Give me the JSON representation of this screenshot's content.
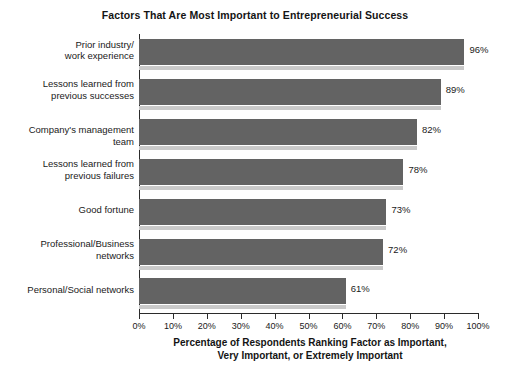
{
  "chart_data": {
    "type": "bar",
    "orientation": "horizontal",
    "title": "Factors That Are Most Important to Entrepreneurial Success",
    "xlabel_line1": "Percentage of Respondents Ranking Factor as Important,",
    "xlabel_line2": "Very Important, or Extremely Important",
    "ylabel": "",
    "xlim": [
      0,
      100
    ],
    "xticks": [
      "0%",
      "10%",
      "20%",
      "30%",
      "40%",
      "50%",
      "60%",
      "70%",
      "80%",
      "90%",
      "100%"
    ],
    "xtick_values": [
      0,
      10,
      20,
      30,
      40,
      50,
      60,
      70,
      80,
      90,
      100
    ],
    "grid": false,
    "legend": false,
    "categories": [
      "Prior industry/\nwork experience",
      "Lessons learned from\nprevious successes",
      "Company's management team",
      "Lessons learned from\nprevious failures",
      "Good fortune",
      "Professional/Business\nnetworks",
      "Personal/Social networks"
    ],
    "values": [
      96,
      89,
      82,
      78,
      73,
      72,
      61
    ],
    "value_labels": [
      "96%",
      "89%",
      "82%",
      "78%",
      "73%",
      "72%",
      "61%"
    ],
    "bar_color": "#636363",
    "shadow_color": "#c9c9c9",
    "axis_color": "#2b2b2b",
    "background": "#ffffff"
  }
}
